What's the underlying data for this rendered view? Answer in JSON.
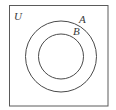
{
  "diagram": {
    "type": "venn",
    "universe": {
      "label": "U",
      "rect": {
        "x": 9,
        "y": 5,
        "width": 99,
        "height": 101
      }
    },
    "sets": [
      {
        "name": "A",
        "label": "A",
        "cx": 61,
        "cy": 56.5,
        "r": 35.5,
        "contains": [
          "B"
        ]
      },
      {
        "name": "B",
        "label": "B",
        "cx": 61,
        "cy": 56.5,
        "r": 22.5
      }
    ],
    "relationship": "B is a subset of A, A is a subset of U",
    "colors": {
      "stroke": "#4a4a4a",
      "text": "#3a3a3a",
      "background": "#ffffff"
    }
  }
}
